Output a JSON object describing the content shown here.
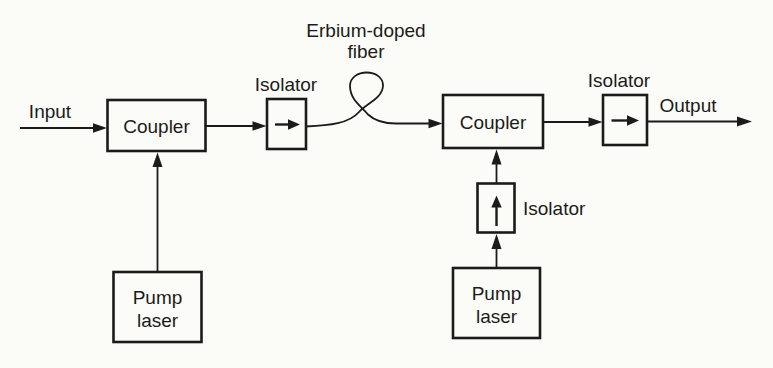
{
  "figure": {
    "colors": {
      "background": "#fbfbf8",
      "ink": "#1b1b19"
    },
    "labels": {
      "input": "Input",
      "output": "Output",
      "coupler_1": "Coupler",
      "coupler_2": "Coupler",
      "isolator_1": "Isolator",
      "isolator_2": "Isolator",
      "isolator_3": "Isolator",
      "fiber_line_1": "Erbium-doped",
      "fiber_line_2": "fiber",
      "pump_1_line_1": "Pump",
      "pump_1_line_2": "laser",
      "pump_2_line_1": "Pump",
      "pump_2_line_2": "laser"
    }
  }
}
